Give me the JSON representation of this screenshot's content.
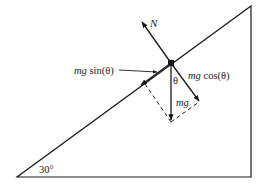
{
  "diagram": {
    "incline_angle_label": "30°",
    "labels": {
      "normal": "N",
      "parallel_component_mg": "mg",
      "parallel_component_fn": " sin(θ)",
      "perpendicular_component_mg": "mg",
      "perpendicular_component_fn": " cos(θ)",
      "weight": "mg",
      "angle_theta": "θ"
    },
    "colors": {
      "stroke": "#1a1a1a",
      "background": "#ffffff"
    }
  }
}
